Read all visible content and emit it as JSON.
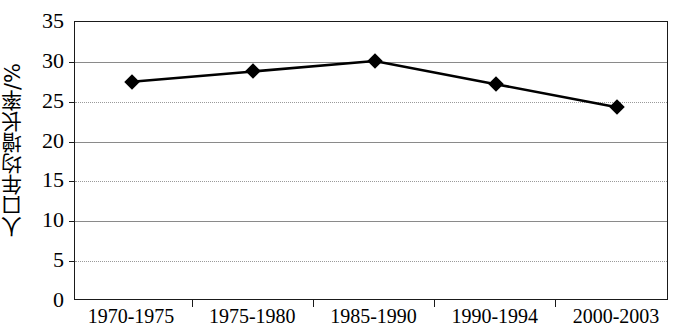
{
  "chart_data": {
    "type": "line",
    "title": "",
    "subtitle": "",
    "xlabel": "",
    "ylabel": "人口年均增长率/%",
    "categories": [
      "1970-1975",
      "1975-1980",
      "1985-1990",
      "1990-1994",
      "2000-2003"
    ],
    "values": [
      27.5,
      28.8,
      30.1,
      27.2,
      24.3
    ],
    "series": [
      {
        "name": "人口年均增长率/%",
        "values": [
          27.5,
          28.8,
          30.1,
          27.2,
          24.3
        ]
      }
    ],
    "ylim": [
      0,
      35
    ],
    "y_ticks": [
      0,
      5,
      10,
      15,
      20,
      25,
      30,
      35
    ],
    "y_tick_labels": [
      "0",
      "5",
      "10",
      "15",
      "20",
      "25",
      "30",
      "35"
    ],
    "x_tick_labels": [
      "1970-1975",
      "1975-1980",
      "1985-1990",
      "1990-1994",
      "2000-2003"
    ],
    "grid": true,
    "grid_axis": "y",
    "legend": false,
    "legend_position": "none",
    "marker": "diamond",
    "line_color": "#000000",
    "marker_color": "#000000",
    "gridline_color": "#8a8a8a",
    "axis_color": "#1a1a1a",
    "background_color": "#ffffff",
    "annotations": []
  }
}
